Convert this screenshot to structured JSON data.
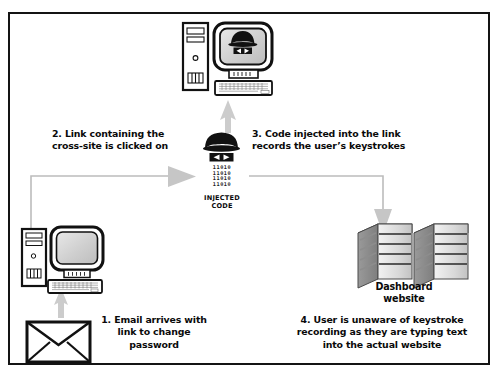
{
  "diagram": {
    "background_color": "#ffffff",
    "border_color": "#141414",
    "arrow_color": "#b8b8b8",
    "text_color": "#0a0a0a"
  },
  "nodes": {
    "attacker_computer": {
      "name": "attacker-computer",
      "icon": "desktop-computer-with-spy-icon",
      "screen_icon": "spy-icon"
    },
    "victim_computer": {
      "name": "victim-computer",
      "icon": "desktop-computer-icon"
    },
    "email": {
      "name": "email-envelope",
      "icon": "envelope-icon"
    },
    "injected_code": {
      "name": "injected-code",
      "icon": "spy-icon",
      "binary": "11010\n11010\n11010\n11010",
      "label": "INJECTED\nCODE"
    },
    "dashboard": {
      "name": "dashboard-servers",
      "icon": "server-tower-icon",
      "label": "Dashboard\nwebsite",
      "count": 2
    }
  },
  "captions": {
    "step1": "1. Email arrives with\nlink to change\npassword",
    "step2": "2. Link containing the\ncross-site is clicked on",
    "step3": "3. Code injected into the link\nrecords the user’s keystrokes",
    "step4": "4. User is unaware of keystroke\nrecording as they are typing text\ninto the actual website"
  },
  "arrows": [
    {
      "name": "arrow-email-to-victim",
      "from": "email",
      "to": "victim_computer",
      "direction": "up"
    },
    {
      "name": "arrow-victim-to-injected-code",
      "from": "victim_computer",
      "to": "injected_code",
      "direction": "up-then-right"
    },
    {
      "name": "arrow-injected-code-to-attacker",
      "from": "injected_code",
      "to": "attacker_computer",
      "direction": "up"
    },
    {
      "name": "arrow-injected-code-to-dashboard",
      "from": "injected_code",
      "to": "dashboard",
      "direction": "right-then-down"
    }
  ]
}
